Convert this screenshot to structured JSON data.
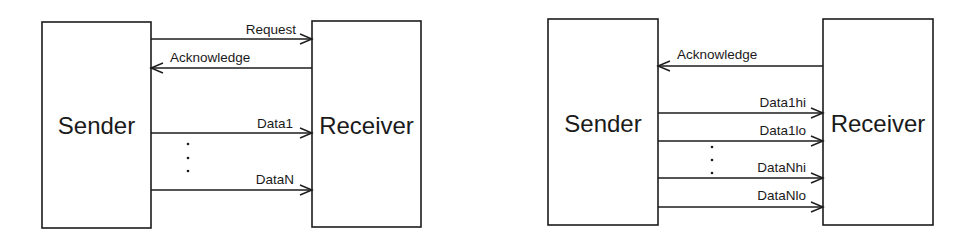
{
  "diagrams": [
    {
      "id": "single-rail",
      "sender": {
        "label": "Sender",
        "x": 42,
        "y": 22,
        "w": 109,
        "h": 206
      },
      "receiver": {
        "label": "Receiver",
        "x": 312,
        "y": 21,
        "w": 109,
        "h": 206
      },
      "signals": [
        {
          "label": "Request",
          "y": 39,
          "direction": "sender-to-receiver"
        },
        {
          "label": "Acknowledge",
          "y": 68,
          "direction": "receiver-to-sender"
        },
        {
          "label": "Data1",
          "y": 133,
          "direction": "sender-to-receiver"
        },
        {
          "label": "DataN",
          "y": 190,
          "direction": "sender-to-receiver"
        }
      ],
      "ellipsis": {
        "x": 188,
        "ys": [
          144,
          158,
          171
        ]
      }
    },
    {
      "id": "dual-rail",
      "sender": {
        "label": "Sender",
        "x": 548,
        "y": 19,
        "w": 110,
        "h": 206
      },
      "receiver": {
        "label": "Receiver",
        "x": 823,
        "y": 19,
        "w": 110,
        "h": 206
      },
      "signals": [
        {
          "label": "Acknowledge",
          "y": 66,
          "direction": "receiver-to-sender"
        },
        {
          "label": "Data1hi",
          "y": 113,
          "direction": "sender-to-receiver"
        },
        {
          "label": "Data1lo",
          "y": 141,
          "direction": "sender-to-receiver"
        },
        {
          "label": "DataNhi",
          "y": 178,
          "direction": "sender-to-receiver"
        },
        {
          "label": "DataNlo",
          "y": 207,
          "direction": "sender-to-receiver"
        }
      ],
      "ellipsis": {
        "x": 712,
        "ys": [
          147,
          160,
          173
        ]
      }
    }
  ],
  "colors": {
    "stroke": "#1c1c1c",
    "text": "#1a1a1a",
    "background": "#ffffff"
  }
}
